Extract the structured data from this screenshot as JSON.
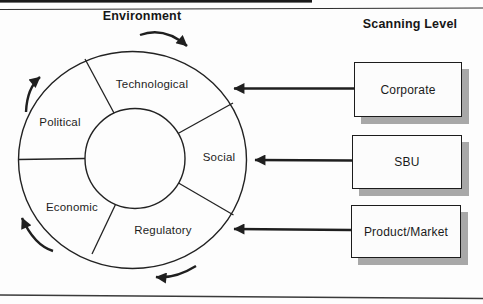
{
  "figure": {
    "left_title": "Environment",
    "right_title": "Scanning Level"
  },
  "environment_wheel": {
    "rotation": "clockwise",
    "segments": [
      {
        "label": "Technological"
      },
      {
        "label": "Political"
      },
      {
        "label": "Social"
      },
      {
        "label": "Economic"
      },
      {
        "label": "Regulatory"
      }
    ]
  },
  "scanning_levels": [
    {
      "label": "Corporate"
    },
    {
      "label": "SBU"
    },
    {
      "label": "Product/Market"
    }
  ],
  "colors": {
    "line": "#1f1f1f",
    "box_shadow": "#a8a8a8",
    "background": "#fdfdfd"
  }
}
